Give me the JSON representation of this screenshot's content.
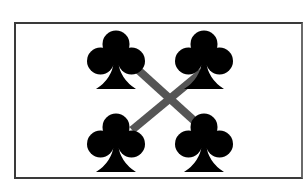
{
  "figure": {
    "symbols": [
      {
        "name": "club",
        "position": "top-left",
        "icon": "club-icon"
      },
      {
        "name": "club",
        "position": "top-right",
        "icon": "club-icon"
      },
      {
        "name": "club",
        "position": "bottom-left",
        "icon": "club-icon"
      },
      {
        "name": "club",
        "position": "bottom-right",
        "icon": "club-icon"
      }
    ],
    "connector": {
      "shape": "X",
      "color": "#555555"
    },
    "colors": {
      "symbol": "#000000",
      "frame": "#3a3a3a",
      "background": "#ffffff"
    }
  }
}
